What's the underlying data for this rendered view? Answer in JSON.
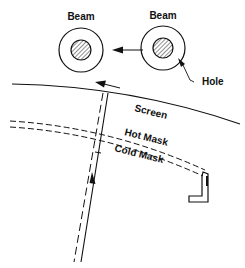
{
  "diagram": {
    "labels": {
      "beam_left": "Beam",
      "beam_right": "Beam",
      "hole": "Hole",
      "screen": "Screen",
      "hot_mask": "Hot Mask",
      "cold_mask": "Cold Mask"
    },
    "colors": {
      "stroke": "#111111",
      "background": "#ffffff"
    }
  }
}
